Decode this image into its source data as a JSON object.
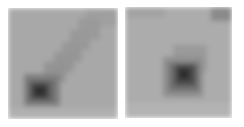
{
  "panels": [
    {
      "id": "left",
      "description": "grayscale patch with diagonal dark streak ending in dark blob at lower-left",
      "box": [
        8,
        8,
        110,
        111
      ],
      "background": "#a8a8a8",
      "blocks": [
        {
          "x": 78,
          "y": 0,
          "w": 32,
          "h": 18,
          "c": "#9f9f9f"
        },
        {
          "x": 70,
          "y": 10,
          "w": 22,
          "h": 22,
          "c": "#9a9a9a"
        },
        {
          "x": 62,
          "y": 22,
          "w": 20,
          "h": 20,
          "c": "#999999"
        },
        {
          "x": 54,
          "y": 34,
          "w": 20,
          "h": 20,
          "c": "#979797"
        },
        {
          "x": 46,
          "y": 44,
          "w": 20,
          "h": 20,
          "c": "#959595"
        },
        {
          "x": 36,
          "y": 54,
          "w": 22,
          "h": 20,
          "c": "#939393"
        },
        {
          "x": 16,
          "y": 66,
          "w": 36,
          "h": 32,
          "c": "#808080"
        },
        {
          "x": 20,
          "y": 72,
          "w": 26,
          "h": 22,
          "c": "#666666"
        },
        {
          "x": 24,
          "y": 76,
          "w": 16,
          "h": 14,
          "c": "#3e3e3e"
        },
        {
          "x": 28,
          "y": 80,
          "w": 8,
          "h": 6,
          "c": "#262626"
        },
        {
          "x": 0,
          "y": 100,
          "w": 110,
          "h": 11,
          "c": "#b0b0b0"
        }
      ]
    },
    {
      "id": "right",
      "description": "grayscale patch with centered dark blob",
      "box": [
        125,
        7,
        107,
        111
      ],
      "background": "#acacac",
      "blocks": [
        {
          "x": 86,
          "y": 0,
          "w": 21,
          "h": 14,
          "c": "#8a8a8a"
        },
        {
          "x": 0,
          "y": 0,
          "w": 40,
          "h": 10,
          "c": "#a2a2a2"
        },
        {
          "x": 48,
          "y": 38,
          "w": 34,
          "h": 28,
          "c": "#9a9a9a"
        },
        {
          "x": 38,
          "y": 50,
          "w": 40,
          "h": 40,
          "c": "#8e8e8e"
        },
        {
          "x": 44,
          "y": 56,
          "w": 30,
          "h": 28,
          "c": "#707070"
        },
        {
          "x": 50,
          "y": 58,
          "w": 20,
          "h": 20,
          "c": "#4a4a4a"
        },
        {
          "x": 54,
          "y": 62,
          "w": 10,
          "h": 10,
          "c": "#2c2c2c"
        },
        {
          "x": 0,
          "y": 96,
          "w": 107,
          "h": 15,
          "c": "#b3b3b3"
        }
      ]
    }
  ]
}
